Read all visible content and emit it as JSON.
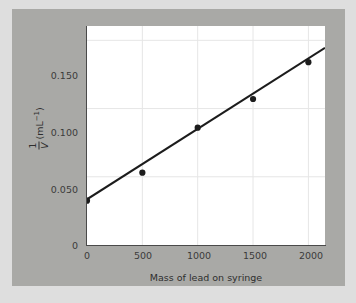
{
  "chart_data": {
    "type": "scatter",
    "title": "",
    "xlabel": "Mass of lead on syringe",
    "ylabel_fraction_numerator": "1",
    "ylabel_fraction_denominator": "V",
    "ylabel_unit": "(mL",
    "ylabel_unit_exponent": "−1",
    "ylabel_unit_close": ")",
    "ylabel": "1/V (mL−1)",
    "x": [
      0,
      500,
      1000,
      1500,
      2000
    ],
    "values": [
      0.0325,
      0.053,
      0.086,
      0.107,
      0.134
    ],
    "series": [
      {
        "name": "Measured points",
        "x": [
          0,
          500,
          1000,
          1500,
          2000
        ],
        "values": [
          0.0325,
          0.053,
          0.086,
          0.107,
          0.134
        ]
      },
      {
        "name": "Best-fit line",
        "type": "line",
        "x": [
          0,
          2150
        ],
        "values": [
          0.0335,
          0.1445
        ]
      }
    ],
    "fit": {
      "intercept": 0.0335,
      "slope": 5.16e-05
    },
    "xlim": [
      0,
      2150
    ],
    "ylim": [
      0,
      0.1605
    ],
    "xticks": [
      0,
      500,
      1000,
      1500,
      2000
    ],
    "xtick_labels": [
      "0",
      "500",
      "1000",
      "1500",
      "2000"
    ],
    "yticks": [
      0,
      0.05,
      0.1,
      0.15
    ],
    "ytick_labels": [
      "0",
      "0.050",
      "0.100",
      "0.150"
    ],
    "grid": true,
    "legend": "none",
    "marker_color": "#1c1c1c",
    "line_color": "#1c1c1c",
    "grid_color": "#e6e6e6",
    "plot_background": "#ffffff",
    "panel_background": "#a9a9a6",
    "figure_background": "#dedede"
  }
}
